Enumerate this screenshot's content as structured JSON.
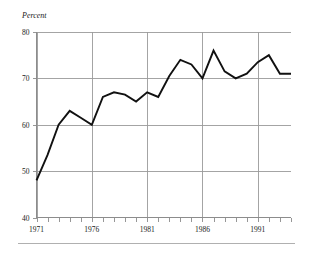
{
  "chart_data": {
    "type": "line",
    "title": "",
    "subtitle": "",
    "xlabel": "",
    "ylabel": "Percent",
    "ylim": [
      40,
      80
    ],
    "xlim": [
      1971,
      1994
    ],
    "grid": true,
    "legend": "none",
    "y_ticks": [
      40,
      50,
      60,
      70,
      80
    ],
    "y_tick_labels": [
      "40",
      "50",
      "60",
      "70",
      "80"
    ],
    "x_ticks": [
      1971,
      1972,
      1973,
      1974,
      1975,
      1976,
      1977,
      1978,
      1979,
      1980,
      1981,
      1982,
      1983,
      1984,
      1985,
      1986,
      1987,
      1988,
      1989,
      1990,
      1991,
      1992,
      1993,
      1994
    ],
    "x_tick_labels": [
      "1971",
      "1976",
      "1981",
      "1986",
      "1991"
    ],
    "x_labeled_years": [
      1971,
      1976,
      1981,
      1986,
      1991
    ],
    "x": [
      1971,
      1972,
      1973,
      1974,
      1975,
      1976,
      1977,
      1978,
      1979,
      1980,
      1981,
      1982,
      1983,
      1984,
      1985,
      1986,
      1987,
      1988,
      1989,
      1990,
      1991,
      1992,
      1993,
      1994
    ],
    "values": [
      48.0,
      53.5,
      60.0,
      63.0,
      61.5,
      60.0,
      66.0,
      67.0,
      66.5,
      65.0,
      67.0,
      66.0,
      70.5,
      74.0,
      73.0,
      70.0,
      76.0,
      71.5,
      70.0,
      71.0,
      73.5,
      75.0,
      71.0,
      71.0
    ],
    "series": [
      {
        "name": "Percent",
        "color": "#111111",
        "values": [
          48.0,
          53.5,
          60.0,
          63.0,
          61.5,
          60.0,
          66.0,
          67.0,
          66.5,
          65.0,
          67.0,
          66.0,
          70.5,
          74.0,
          73.0,
          70.0,
          76.0,
          71.5,
          70.0,
          71.0,
          73.5,
          75.0,
          71.0,
          71.0
        ]
      }
    ],
    "colors": {
      "line": "#111111",
      "grid": "#9a9a9a",
      "axis": "#8c8c8c",
      "text": "#1a1a1a",
      "background": "#ffffff",
      "footer_rule": "#b0b0b0"
    }
  },
  "figure": {
    "axis_title": "Percent",
    "footer_rule_visible": true
  }
}
